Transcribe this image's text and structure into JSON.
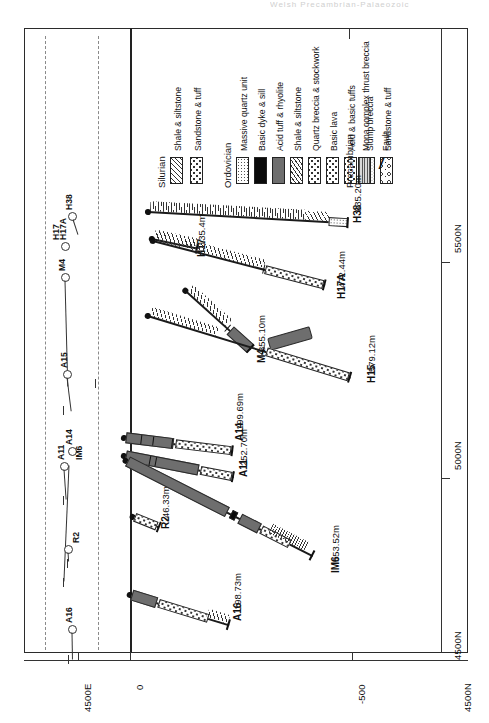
{
  "figure": {
    "title_truncated": "Welsh Precambrian-Palaeozoic",
    "axes": {
      "horizontal_label": "4500E",
      "vertical_labels": [
        "0",
        "-500"
      ],
      "right_label": "4500N",
      "top_label": "5500N",
      "mid_label": "5000N",
      "bottom_label": "4500N"
    }
  },
  "legend": {
    "groups": [
      {
        "name": "Silurian",
        "items": [
          {
            "label": "Shale & siltstone",
            "pattern": "p-hatch"
          },
          {
            "label": "Sandstone & tuff",
            "pattern": "p-dotsbig"
          }
        ]
      },
      {
        "name": "Ordovician",
        "items": [
          {
            "label": "Massive quartz unit",
            "pattern": "p-dotsfine"
          },
          {
            "label": "Basic dyke & sill",
            "pattern": "p-black"
          },
          {
            "label": "Acid tuff & rhyolite",
            "pattern": "p-gray"
          },
          {
            "label": "Shale & siltstone",
            "pattern": "p-hatchsteep"
          },
          {
            "label": "Quartz breccia & stockwork",
            "pattern": "p-dotsbig"
          },
          {
            "label": "Basic lava",
            "pattern": "p-dotsbig"
          },
          {
            "label": "Acid & basic tuffs",
            "pattern": "p-dotsbig"
          },
          {
            "label": "Slump breccia",
            "pattern": "p-circ"
          },
          {
            "label": "Sandstone & tuff",
            "pattern": "p-mixed"
          }
        ]
      },
      {
        "name": "Precambrian",
        "items": [
          {
            "label": "Mona complex thrust breccia",
            "pattern": "p-vlines"
          },
          {
            "label": "Fault",
            "pattern": "fault"
          }
        ]
      }
    ]
  },
  "boreholes": [
    {
      "name": "H38",
      "depth": "635.20m"
    },
    {
      "name": "H17",
      "depth": "135.4m"
    },
    {
      "name": "H17A",
      "depth": "472.44m"
    },
    {
      "name": "M4",
      "depth": "355.10m"
    },
    {
      "name": "H15",
      "depth": "579.12m"
    },
    {
      "name": "A14",
      "depth": "199.69m"
    },
    {
      "name": "A11",
      "depth": "252.70m"
    },
    {
      "name": "R2",
      "depth": "46.33m"
    },
    {
      "name": "IM6",
      "depth": "553.52m"
    },
    {
      "name": "A16",
      "depth": "198.73m"
    }
  ],
  "plan_view": {
    "hole_labels": [
      "H38",
      "H17A",
      "H17",
      "M4",
      "A15",
      "A14",
      "A11",
      "IM6",
      "R2",
      "A16"
    ]
  },
  "colors": {
    "line": "#1b1b1b",
    "quartz_unit": "#6e6e6e",
    "basic_dyke": "#0a0a0a",
    "guide_dashed": "#8a8a8a"
  }
}
